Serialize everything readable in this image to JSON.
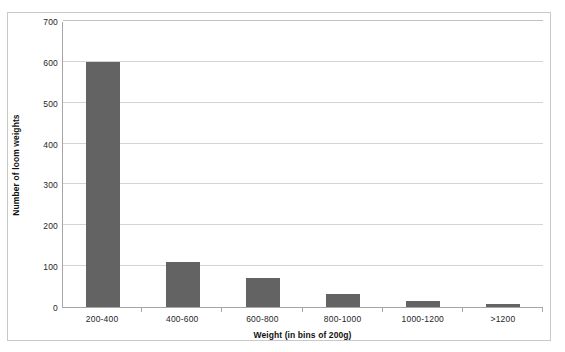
{
  "chart_data": {
    "type": "bar",
    "title": "",
    "xlabel": "Weight (in bins of 200g)",
    "ylabel": "Number of loom weights",
    "categories": [
      "200-400",
      "400-600",
      "600-800",
      "800-1000",
      "1000-1200",
      ">1200"
    ],
    "values": [
      600,
      110,
      72,
      32,
      15,
      8
    ],
    "series": [
      {
        "name": "Number of loom weights",
        "values": [
          600,
          110,
          72,
          32,
          15,
          8
        ]
      }
    ],
    "ylim": [
      0,
      700
    ],
    "y_ticks": [
      0,
      100,
      200,
      300,
      400,
      500,
      600,
      700
    ],
    "y_tick_labels": [
      "0",
      "100",
      "200",
      "300",
      "400",
      "500",
      "600",
      "700"
    ],
    "grid": "horizontal",
    "legend": "none",
    "bar_color": "#636363",
    "gridline_color": "#d4d4d4",
    "axis_color": "#a6a6a6",
    "plot_background": "#ffffff",
    "frame_border_color": "#c9c9c9"
  },
  "axes": {
    "y_title": "Number of loom weights",
    "x_title": "Weight (in bins of 200g)"
  }
}
